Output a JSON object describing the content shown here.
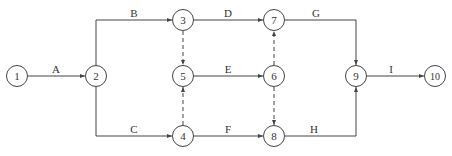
{
  "diagram": {
    "type": "activity-on-arrow network",
    "colors": {
      "line": "#444444",
      "text": "#333333",
      "background": "#ffffff"
    },
    "nodes": [
      {
        "id": "1",
        "label": "1",
        "x": 17,
        "y": 76
      },
      {
        "id": "2",
        "label": "2",
        "x": 96,
        "y": 76
      },
      {
        "id": "3",
        "label": "3",
        "x": 183,
        "y": 20
      },
      {
        "id": "4",
        "label": "4",
        "x": 183,
        "y": 136
      },
      {
        "id": "5",
        "label": "5",
        "x": 183,
        "y": 76
      },
      {
        "id": "6",
        "label": "6",
        "x": 274,
        "y": 76
      },
      {
        "id": "7",
        "label": "7",
        "x": 274,
        "y": 20
      },
      {
        "id": "8",
        "label": "8",
        "x": 274,
        "y": 136
      },
      {
        "id": "9",
        "label": "9",
        "x": 356,
        "y": 76
      },
      {
        "id": "10",
        "label": "10",
        "x": 435,
        "y": 76
      }
    ],
    "activities": [
      {
        "label": "A",
        "from": "1",
        "to": "2"
      },
      {
        "label": "B",
        "from": "2",
        "to": "3"
      },
      {
        "label": "C",
        "from": "2",
        "to": "4"
      },
      {
        "label": "D",
        "from": "3",
        "to": "7"
      },
      {
        "label": "E",
        "from": "5",
        "to": "6"
      },
      {
        "label": "F",
        "from": "4",
        "to": "8"
      },
      {
        "label": "G",
        "from": "7",
        "to": "9"
      },
      {
        "label": "H",
        "from": "8",
        "to": "9"
      },
      {
        "label": "I",
        "from": "9",
        "to": "10"
      }
    ],
    "dummy_activities": [
      {
        "from": "3",
        "to": "5"
      },
      {
        "from": "4",
        "to": "5"
      },
      {
        "from": "6",
        "to": "7"
      },
      {
        "from": "6",
        "to": "8"
      }
    ]
  }
}
